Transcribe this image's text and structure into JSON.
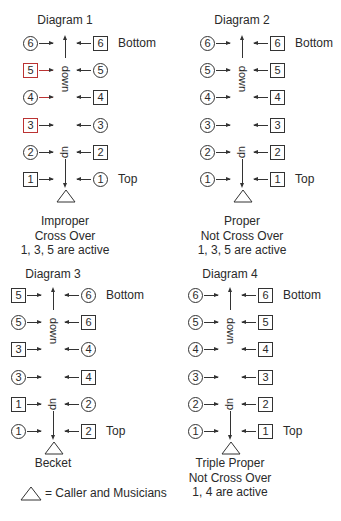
{
  "diagrams": [
    {
      "title": "Diagram 1",
      "bottom_label": "Bottom",
      "top_label": "Top",
      "down_label": "down",
      "up_label": "up",
      "rows": [
        {
          "left": {
            "shape": "circle",
            "num": "6"
          },
          "right": {
            "shape": "square",
            "num": "6"
          }
        },
        {
          "left": {
            "shape": "square",
            "num": "5"
          },
          "right": {
            "shape": "circle",
            "num": "5"
          }
        },
        {
          "left": {
            "shape": "circle",
            "num": "4"
          },
          "right": {
            "shape": "square",
            "num": "4"
          }
        },
        {
          "left": {
            "shape": "square",
            "num": "3"
          },
          "right": {
            "shape": "circle",
            "num": "3"
          }
        },
        {
          "left": {
            "shape": "circle",
            "num": "2"
          },
          "right": {
            "shape": "square",
            "num": "2"
          }
        },
        {
          "left": {
            "shape": "square",
            "num": "1"
          },
          "right": {
            "shape": "circle",
            "num": "1"
          }
        }
      ],
      "caption": [
        "Improper",
        "Cross Over",
        "1, 3, 5 are active"
      ]
    },
    {
      "title": "Diagram 2",
      "bottom_label": "Bottom",
      "top_label": "Top",
      "down_label": "down",
      "up_label": "up",
      "rows": [
        {
          "left": {
            "shape": "circle",
            "num": "6"
          },
          "right": {
            "shape": "square",
            "num": "6"
          }
        },
        {
          "left": {
            "shape": "circle",
            "num": "5"
          },
          "right": {
            "shape": "square",
            "num": "5"
          }
        },
        {
          "left": {
            "shape": "circle",
            "num": "4"
          },
          "right": {
            "shape": "square",
            "num": "4"
          }
        },
        {
          "left": {
            "shape": "circle",
            "num": "3"
          },
          "right": {
            "shape": "square",
            "num": "3"
          }
        },
        {
          "left": {
            "shape": "circle",
            "num": "2"
          },
          "right": {
            "shape": "square",
            "num": "2"
          }
        },
        {
          "left": {
            "shape": "circle",
            "num": "1"
          },
          "right": {
            "shape": "square",
            "num": "1"
          }
        }
      ],
      "caption": [
        "Proper",
        "Not Cross Over",
        "1, 3, 5 are active"
      ]
    },
    {
      "title": "Diagram 3",
      "bottom_label": "Bottom",
      "top_label": "Top",
      "down_label": "down",
      "up_label": "up",
      "rows": [
        {
          "left": {
            "shape": "square",
            "num": "5"
          },
          "right": {
            "shape": "circle",
            "num": "6"
          }
        },
        {
          "left": {
            "shape": "circle",
            "num": "5"
          },
          "right": {
            "shape": "square",
            "num": "6"
          }
        },
        {
          "left": {
            "shape": "square",
            "num": "3"
          },
          "right": {
            "shape": "circle",
            "num": "4"
          }
        },
        {
          "left": {
            "shape": "circle",
            "num": "3"
          },
          "right": {
            "shape": "square",
            "num": "4"
          }
        },
        {
          "left": {
            "shape": "square",
            "num": "1"
          },
          "right": {
            "shape": "circle",
            "num": "2"
          }
        },
        {
          "left": {
            "shape": "circle",
            "num": "1"
          },
          "right": {
            "shape": "square",
            "num": "2"
          }
        }
      ],
      "caption": [
        "Becket"
      ]
    },
    {
      "title": "Diagram 4",
      "bottom_label": "Bottom",
      "top_label": "Top",
      "down_label": "down",
      "up_label": "up",
      "rows": [
        {
          "left": {
            "shape": "circle",
            "num": "6"
          },
          "right": {
            "shape": "square",
            "num": "6"
          }
        },
        {
          "left": {
            "shape": "circle",
            "num": "5"
          },
          "right": {
            "shape": "square",
            "num": "5"
          }
        },
        {
          "left": {
            "shape": "circle",
            "num": "4"
          },
          "right": {
            "shape": "square",
            "num": "4"
          }
        },
        {
          "left": {
            "shape": "circle",
            "num": "3"
          },
          "right": {
            "shape": "square",
            "num": "3"
          }
        },
        {
          "left": {
            "shape": "circle",
            "num": "2"
          },
          "right": {
            "shape": "square",
            "num": "2"
          }
        },
        {
          "left": {
            "shape": "circle",
            "num": "1"
          },
          "right": {
            "shape": "square",
            "num": "1"
          }
        }
      ],
      "caption": [
        "Triple Proper",
        "Not Cross Over",
        "1, 4 are active"
      ]
    }
  ],
  "legend": {
    "symbol": "triangle",
    "text": "= Caller and Musicians"
  }
}
